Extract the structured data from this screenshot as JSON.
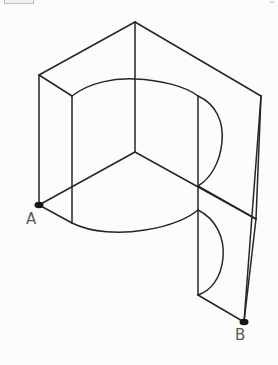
{
  "page": {
    "domain": "Diagram",
    "background_color": "#fcfcfc",
    "stroke_color": "#262626",
    "label_color": "#5a5a5a",
    "width": 278,
    "height": 365
  },
  "labels": {
    "point_a": "A",
    "point_b": "B"
  },
  "markers": [
    {
      "name": "point-a-marker",
      "x": 39,
      "y": 205,
      "label": "A"
    },
    {
      "name": "point-b-marker",
      "x": 244,
      "y": 322,
      "label": "B"
    }
  ],
  "geometry": {
    "description": "Axonometric wireframe: two flat vertical panels meeting at a vertical corner edge, joined by a curved (cylindrical) surface; an S-shaped semicircular cutout profile appears on the right face.",
    "vertices": {
      "apex_top": [
        135,
        22
      ],
      "left_top_outer": [
        39,
        75
      ],
      "left_top_inner": [
        72,
        96
      ],
      "right_top_outer": [
        261,
        96
      ],
      "right_top_inner": [
        198,
        96
      ],
      "center_junction": [
        135,
        152
      ],
      "point_a": [
        39,
        205
      ],
      "left_bottom_inner": [
        72,
        223
      ],
      "point_b": [
        244,
        322
      ],
      "right_mid_outer": [
        256,
        219
      ],
      "right_bottom_inner": [
        198,
        295
      ]
    },
    "straight_edges": [
      {
        "name": "apex-to-left-top",
        "from": [
          135,
          22
        ],
        "to": [
          39,
          75
        ]
      },
      {
        "name": "apex-to-right-top",
        "from": [
          135,
          22
        ],
        "to": [
          261,
          96
        ]
      },
      {
        "name": "apex-vertical-edge",
        "from": [
          135,
          22
        ],
        "to": [
          135,
          152
        ]
      },
      {
        "name": "left-outer-vertical",
        "from": [
          39,
          75
        ],
        "to": [
          39,
          205
        ]
      },
      {
        "name": "left-top-short-edge",
        "from": [
          39,
          75
        ],
        "to": [
          72,
          96
        ]
      },
      {
        "name": "left-inner-vertical",
        "from": [
          72,
          96
        ],
        "to": [
          72,
          223
        ]
      },
      {
        "name": "center-to-a",
        "from": [
          135,
          152
        ],
        "to": [
          39,
          205
        ]
      },
      {
        "name": "center-to-right-mid",
        "from": [
          135,
          152
        ],
        "to": [
          256,
          219
        ]
      },
      {
        "name": "a-to-left-bottom-inner",
        "from": [
          39,
          205
        ],
        "to": [
          72,
          223
        ]
      },
      {
        "name": "right-inner-vertical",
        "from": [
          198,
          96
        ],
        "to": [
          198,
          295
        ]
      },
      {
        "name": "right-outer-vertical",
        "from": [
          261,
          96
        ],
        "to": [
          256,
          219
        ]
      },
      {
        "name": "right-outer-to-b",
        "from": [
          261,
          96
        ],
        "to": [
          244,
          322
        ]
      },
      {
        "name": "right-mid-to-b",
        "from": [
          256,
          219
        ],
        "to": [
          244,
          322
        ]
      },
      {
        "name": "inner-mid-to-right-mid",
        "from": [
          198,
          186
        ],
        "to": [
          256,
          219
        ]
      },
      {
        "name": "bottom-inner-to-b",
        "from": [
          198,
          295
        ],
        "to": [
          244,
          322
        ]
      }
    ],
    "curves": [
      {
        "name": "upper-elliptical-arc",
        "from": [
          72,
          96
        ],
        "to": [
          198,
          96
        ],
        "note": "top rim of curved surface passing through apex vertical at y=80"
      },
      {
        "name": "upper-semicircle-cut",
        "from": [
          198,
          96
        ],
        "to": [
          198,
          186
        ],
        "note": "bulges right to x=222"
      },
      {
        "name": "lower-elliptical-arc",
        "from": [
          72,
          223
        ],
        "to": [
          198,
          210
        ],
        "note": "bottom rim of curved surface, sagging to y=232"
      },
      {
        "name": "lower-semicircle-cut",
        "from": [
          198,
          210
        ],
        "to": [
          198,
          295
        ],
        "note": "bulges right to x=222"
      },
      {
        "name": "right-outer-arc",
        "from": [
          261,
          96
        ],
        "to": [
          256,
          219
        ],
        "note": "faint outer silhouette of curved surface"
      }
    ]
  }
}
